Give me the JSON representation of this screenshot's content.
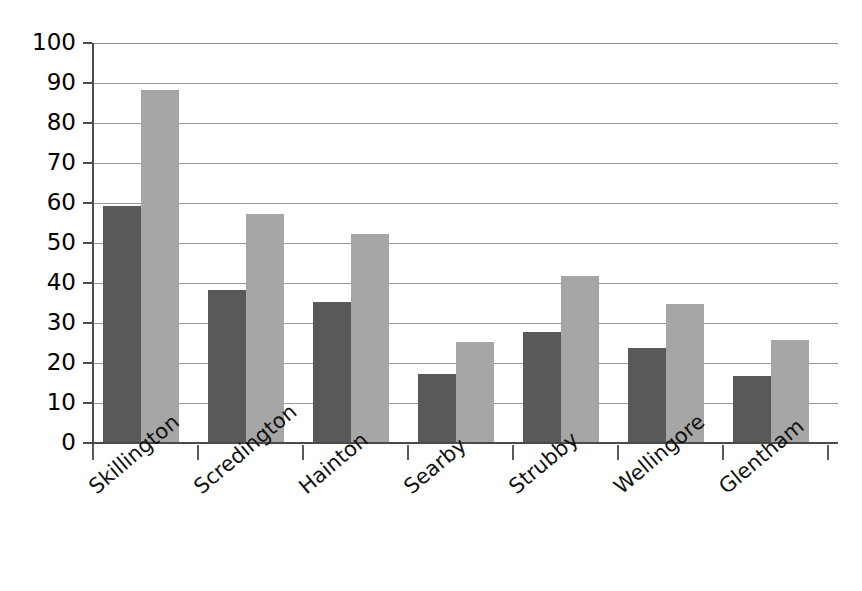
{
  "chart_data": {
    "type": "bar",
    "title": "",
    "subtitle": "",
    "xlabel": "",
    "ylabel": "",
    "categories": [
      "Skillington",
      "Scredington",
      "Hainton",
      "Searby",
      "Strubby",
      "Wellingore",
      "Glentham"
    ],
    "series": [
      {
        "name": "Series 1",
        "color": "#595959",
        "values": [
          59,
          38,
          35,
          17,
          27.5,
          23.5,
          16.5
        ]
      },
      {
        "name": "Series 2",
        "color": "#a6a6a6",
        "values": [
          88,
          57,
          52,
          25,
          41.5,
          34.5,
          25.5
        ]
      }
    ],
    "ylim": [
      0,
      100
    ],
    "ytick_labels": [
      "0",
      "10",
      "20",
      "30",
      "40",
      "50",
      "60",
      "70",
      "80",
      "90",
      "100"
    ],
    "ytick_values": [
      0,
      10,
      20,
      30,
      40,
      50,
      60,
      70,
      80,
      90,
      100
    ],
    "grid": true,
    "grid_axis": "y",
    "legend": false,
    "legend_position": "none",
    "background_color": "#ffffff",
    "axis_color": "#4a4a4a",
    "gridline_color": "#9a9a9a"
  }
}
